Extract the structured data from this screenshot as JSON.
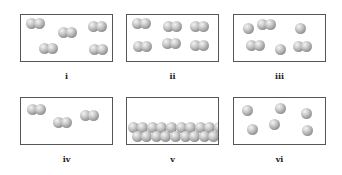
{
  "figure": {
    "panels": [
      {
        "id": "i",
        "label": "i",
        "kind": "diatomic molecules",
        "count": 5,
        "molecules": [
          [
            14,
            8
          ],
          [
            46,
            17
          ],
          [
            76,
            11
          ],
          [
            27,
            33
          ],
          [
            77,
            34
          ]
        ]
      },
      {
        "id": "ii",
        "label": "ii",
        "kind": "diatomic molecules",
        "count": 6,
        "molecules": [
          [
            14,
            8
          ],
          [
            45,
            11
          ],
          [
            72,
            11
          ],
          [
            15,
            31
          ],
          [
            44,
            28
          ],
          [
            72,
            30
          ]
        ]
      },
      {
        "id": "iii",
        "label": "iii",
        "kind": "mixture of atoms and diatomic molecules",
        "atoms": [
          [
            14,
            13
          ],
          [
            66,
            13
          ],
          [
            46,
            34
          ]
        ],
        "molecules": [
          [
            32,
            9
          ],
          [
            21,
            30
          ],
          [
            68,
            31
          ]
        ]
      },
      {
        "id": "iv",
        "label": "iv",
        "kind": "diatomic molecules",
        "count": 3,
        "molecules": [
          [
            15,
            11
          ],
          [
            41,
            24
          ],
          [
            68,
            17
          ]
        ]
      },
      {
        "id": "v",
        "label": "v",
        "kind": "condensed (liquid/solid) layer of atoms at bottom"
      },
      {
        "id": "vi",
        "label": "vi",
        "kind": "single atoms",
        "count": 6,
        "atoms": [
          [
            13,
            12
          ],
          [
            46,
            10
          ],
          [
            72,
            15
          ],
          [
            18,
            31
          ],
          [
            40,
            26
          ],
          [
            73,
            32
          ]
        ]
      }
    ]
  }
}
